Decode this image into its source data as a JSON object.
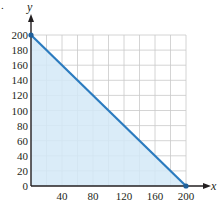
{
  "chart_data": {
    "type": "area",
    "title": "",
    "xlabel": "x",
    "ylabel": "y",
    "xlim": [
      0,
      200
    ],
    "ylim": [
      0,
      200
    ],
    "grid": true,
    "grid_step": 20,
    "x_ticks": [
      40,
      80,
      120,
      160,
      200
    ],
    "y_ticks": [
      0,
      20,
      40,
      60,
      80,
      100,
      120,
      140,
      160,
      180,
      200
    ],
    "series": [
      {
        "name": "boundary line",
        "points": [
          [
            0,
            200
          ],
          [
            200,
            0
          ]
        ],
        "shaded_region": "below line, above x-axis, right of y-axis",
        "endpoints_marked": true
      }
    ],
    "colors": {
      "line": "#2b7bbf",
      "fill": "#d3e9f7",
      "grid": "#c9c9c9",
      "axis": "#231f20"
    },
    "annotations": [
      "."
    ]
  },
  "labels": {
    "x_axis": "x",
    "y_axis": "y",
    "corner_mark": "."
  }
}
